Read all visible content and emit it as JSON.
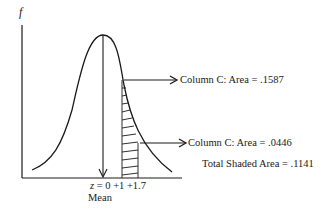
{
  "diagram": {
    "type": "normal-distribution",
    "y_axis_label": "f",
    "x_axis": {
      "z_prefix": "z",
      "ticks_label": "= 0 +1 +1.7",
      "ticks": [
        "0",
        "+1",
        "+1.7"
      ],
      "mean_label": "Mean"
    },
    "annotations": [
      {
        "id": "area-at-z1",
        "text": "Column C: Area = .1587"
      },
      {
        "id": "area-at-z17",
        "text": "Column C: Area = .0446"
      }
    ],
    "total_label": "Total Shaded Area = .1141",
    "colors": {
      "line": "#1a1a1a",
      "background": "#ffffff"
    }
  }
}
